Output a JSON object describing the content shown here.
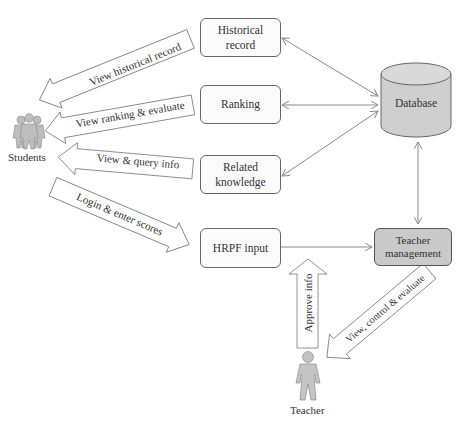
{
  "diagram": {
    "actors": {
      "students": {
        "label": "Students"
      },
      "teacher": {
        "label": "Teacher"
      }
    },
    "modules": {
      "historical_record": {
        "line1": "Historical",
        "line2": "record"
      },
      "ranking": {
        "label": "Ranking"
      },
      "related_knowledge": {
        "line1": "Related",
        "line2": "knowledge"
      },
      "hrpf_input": {
        "label": "HRPF input"
      },
      "database": {
        "label": "Database"
      },
      "teacher_management": {
        "line1": "Teacher",
        "line2": "management"
      }
    },
    "flows": {
      "view_historical_record": "View historical record",
      "view_ranking_evaluate": "View ranking & evaluate",
      "view_query_info": "View & query info",
      "login_enter_scores": "Login & enter scores",
      "approve_info": "Approve info",
      "view_control_evaluate": "View, control & evaluate"
    },
    "colors": {
      "stroke": "#666666",
      "connector": "#8a8a8a",
      "database_fill": "#cfcfcf",
      "teacher_mgmt_fill": "#c9c9c9",
      "actor_fill": "#bdbdbd"
    }
  }
}
